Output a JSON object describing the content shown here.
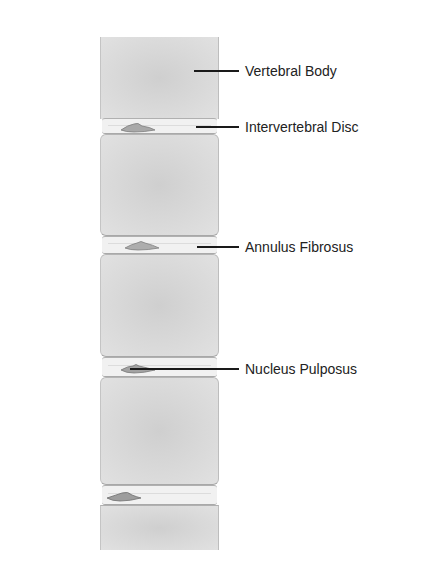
{
  "diagram": {
    "labels": [
      {
        "id": "vertebral-body",
        "text": "Vertebral Body"
      },
      {
        "id": "intervertebral-disc",
        "text": "Intervertebral Disc"
      },
      {
        "id": "annulus-fibrosus",
        "text": "Annulus Fibrosus"
      },
      {
        "id": "nucleus-pulposus",
        "text": "Nucleus Pulposus"
      }
    ],
    "colors": {
      "vertebral_body": "#d6d6d6",
      "disc": "#f1f1f1",
      "nucleus": "#9a9a9a",
      "leader_line": "#1a1a1a",
      "text": "#222222"
    }
  }
}
